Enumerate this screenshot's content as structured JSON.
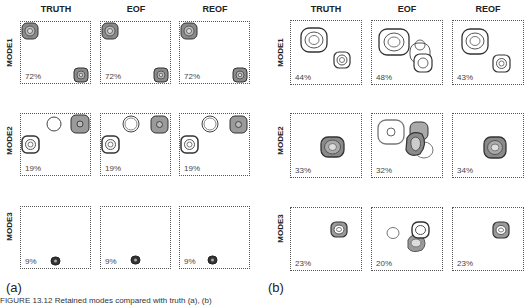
{
  "figure": {
    "caption": "FIGURE 13.12 Retained modes compared with truth (a), (b)",
    "colors": {
      "border": "#555555",
      "contour": "#444444",
      "fill_dark": "#8a8a8a",
      "fill_light": "#cfcfcf"
    }
  },
  "panel_a": {
    "label": "(a)",
    "columns": [
      "TRUTH",
      "EOF",
      "REOF"
    ],
    "rows": [
      "MODE1",
      "MODE2",
      "MODE3"
    ],
    "percentages": [
      [
        "72%",
        "72%",
        "72%"
      ],
      [
        "19%",
        "19%",
        "19%"
      ],
      [
        "9%",
        "9%",
        "9%"
      ]
    ]
  },
  "panel_b": {
    "label": "(b)",
    "columns": [
      "TRUTH",
      "EOF",
      "REOF"
    ],
    "rows": [
      "MODE1",
      "MODE2",
      "MODE3"
    ],
    "percentages": [
      [
        "44%",
        "48%",
        "43%"
      ],
      [
        "33%",
        "32%",
        "34%"
      ],
      [
        "23%",
        "20%",
        "23%"
      ]
    ]
  }
}
